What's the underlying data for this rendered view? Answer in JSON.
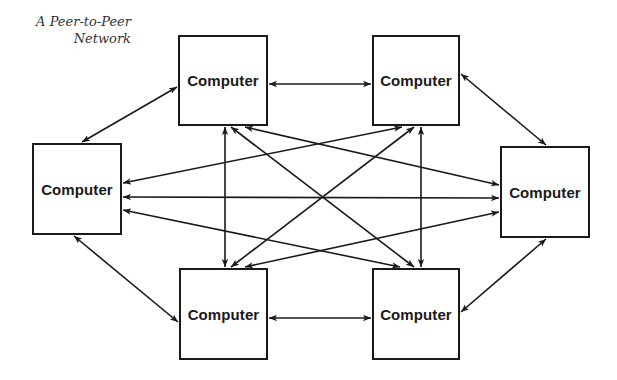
{
  "caption": {
    "line1": "A Peer-to-Peer",
    "line2": "Network"
  },
  "nodes": [
    {
      "id": "top-left",
      "label": "Computer"
    },
    {
      "id": "top-right",
      "label": "Computer"
    },
    {
      "id": "left",
      "label": "Computer"
    },
    {
      "id": "right",
      "label": "Computer"
    },
    {
      "id": "bottom-left",
      "label": "Computer"
    },
    {
      "id": "bottom-right",
      "label": "Computer"
    }
  ],
  "edges": [
    {
      "from": "top-left",
      "to": "top-right",
      "type": "bidirectional"
    },
    {
      "from": "bottom-left",
      "to": "bottom-right",
      "type": "bidirectional"
    },
    {
      "from": "left",
      "to": "top-left",
      "type": "bidirectional"
    },
    {
      "from": "top-right",
      "to": "right",
      "type": "bidirectional"
    },
    {
      "from": "left",
      "to": "bottom-left",
      "type": "bidirectional"
    },
    {
      "from": "right",
      "to": "bottom-right",
      "type": "bidirectional"
    },
    {
      "from": "top-left",
      "to": "bottom-left",
      "type": "bidirectional"
    },
    {
      "from": "top-right",
      "to": "bottom-right",
      "type": "bidirectional"
    },
    {
      "from": "left",
      "to": "right",
      "type": "bidirectional"
    },
    {
      "from": "top-left",
      "to": "bottom-right",
      "type": "bidirectional"
    },
    {
      "from": "top-right",
      "to": "bottom-left",
      "type": "bidirectional"
    },
    {
      "from": "top-left",
      "to": "right",
      "type": "bidirectional"
    },
    {
      "from": "top-right",
      "to": "left",
      "type": "bidirectional"
    },
    {
      "from": "bottom-left",
      "to": "right",
      "type": "bidirectional"
    },
    {
      "from": "bottom-right",
      "to": "left",
      "type": "bidirectional"
    }
  ],
  "colors": {
    "stroke": "#1a1a1a",
    "caption": "#333333",
    "background": "#ffffff"
  }
}
